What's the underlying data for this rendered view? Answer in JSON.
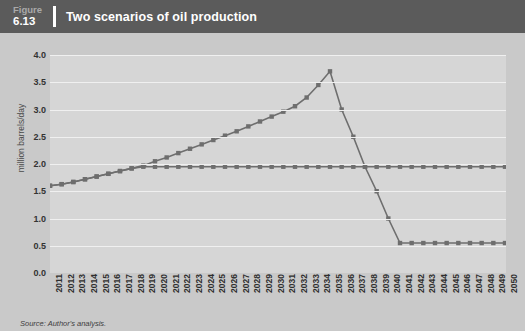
{
  "header": {
    "figure_word": "Figure",
    "figure_number": "6.13",
    "title": "Two scenarios of oil production"
  },
  "footer": {
    "source": "Source: Author's analysis."
  },
  "colors": {
    "titlebar_bg": "#5b5b5b",
    "page_bg": "#c9c9c9",
    "plot_bg": "#d6d6d6",
    "gridline": "#f0f0f0",
    "series_line": "#6e6e6e",
    "title_text": "#ffffff",
    "figure_word_text": "#a9a9a9"
  },
  "chart_data": {
    "type": "line",
    "title": "Two scenarios of oil production",
    "xlabel": "",
    "ylabel": "million barrels/day",
    "ylim": [
      0.0,
      4.0
    ],
    "ytick_step": 0.5,
    "yticks": [
      "0.0",
      "0.5",
      "1.0",
      "1.5",
      "2.0",
      "2.5",
      "3.0",
      "3.5",
      "4.0"
    ],
    "grid": true,
    "legend": "none",
    "marker": "square",
    "categories": [
      "2011",
      "2012",
      "2013",
      "2014",
      "2015",
      "2016",
      "2017",
      "2018",
      "2019",
      "2020",
      "2021",
      "2022",
      "2023",
      "2024",
      "2025",
      "2026",
      "2027",
      "2028",
      "2029",
      "2030",
      "2031",
      "2032",
      "2033",
      "2034",
      "2035",
      "2036",
      "2037",
      "2038",
      "2039",
      "2040",
      "2041",
      "2042",
      "2043",
      "2044",
      "2045",
      "2046",
      "2047",
      "2048",
      "2049",
      "2050"
    ],
    "series": [
      {
        "name": "Peak-and-decline scenario",
        "values": [
          1.6,
          1.63,
          1.67,
          1.72,
          1.77,
          1.82,
          1.87,
          1.92,
          1.97,
          2.05,
          2.12,
          2.2,
          2.28,
          2.36,
          2.44,
          2.52,
          2.6,
          2.69,
          2.78,
          2.87,
          2.96,
          3.06,
          3.22,
          3.45,
          3.7,
          3.0,
          2.5,
          1.95,
          1.5,
          1.0,
          0.55,
          0.55,
          0.55,
          0.55,
          0.55,
          0.55,
          0.55,
          0.55,
          0.55,
          0.55
        ]
      },
      {
        "name": "Plateau scenario",
        "values": [
          1.6,
          1.63,
          1.67,
          1.72,
          1.77,
          1.82,
          1.87,
          1.92,
          1.95,
          1.95,
          1.95,
          1.95,
          1.95,
          1.95,
          1.95,
          1.95,
          1.95,
          1.95,
          1.95,
          1.95,
          1.95,
          1.95,
          1.95,
          1.95,
          1.95,
          1.95,
          1.95,
          1.95,
          1.95,
          1.95,
          1.95,
          1.95,
          1.95,
          1.95,
          1.95,
          1.95,
          1.95,
          1.95,
          1.95,
          1.95
        ]
      }
    ]
  }
}
